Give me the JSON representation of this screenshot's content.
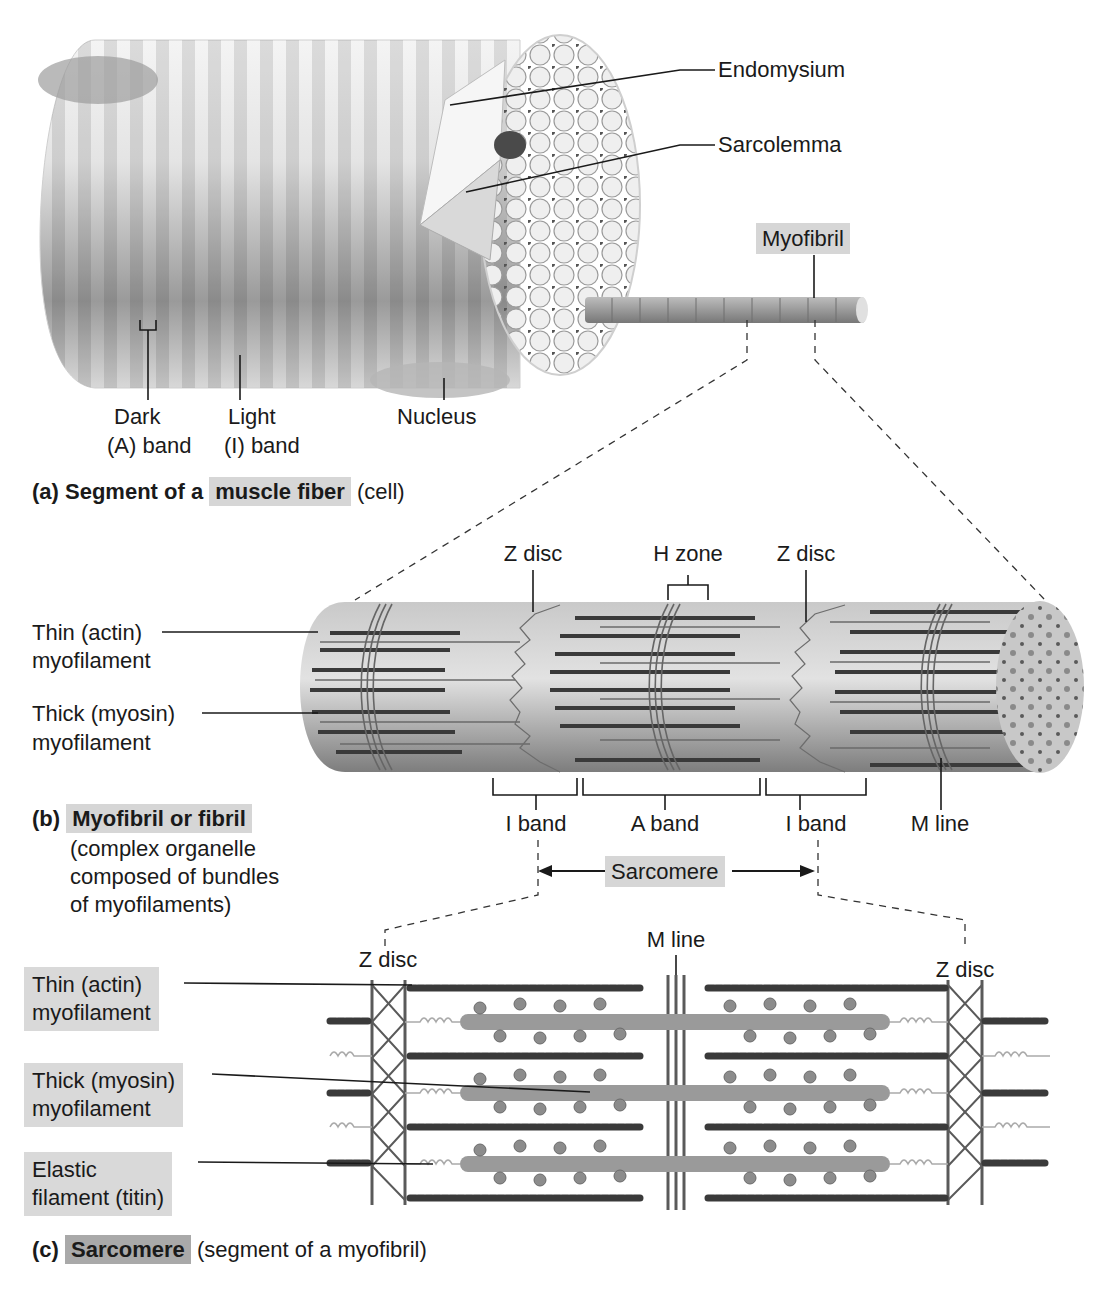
{
  "figure": {
    "colors": {
      "label_highlight": "#d6d6d6",
      "label_highlight_dark": "#a9a9a9",
      "line": "#1a1a1a",
      "fiber_light": "#e6e6e6",
      "fiber_dark": "#8a8a8a",
      "filament_thick": "#3a3a3a",
      "filament_thin": "#6a6a6a"
    }
  },
  "panel_a": {
    "labels": {
      "endomysium": "Endomysium",
      "sarcolemma": "Sarcolemma",
      "myofibril": "Myofibril",
      "dark_band_line1": "Dark",
      "dark_band_line2": "(A) band",
      "light_band_line1": "Light",
      "light_band_line2": "(I) band",
      "nucleus": "Nucleus"
    },
    "caption": {
      "letter": "(a)",
      "bold_prefix": "Segment of a",
      "bold_highlight": "muscle fiber",
      "suffix": "(cell)"
    }
  },
  "panel_b": {
    "labels": {
      "z_disc_left": "Z disc",
      "h_zone": "H zone",
      "z_disc_right": "Z disc",
      "thin_line1": "Thin (actin)",
      "thin_line2": "myofilament",
      "thick_line1": "Thick (myosin)",
      "thick_line2": "myofilament",
      "i_band_left": "I band",
      "a_band": "A band",
      "i_band_right": "I band",
      "m_line": "M line",
      "sarcomere": "Sarcomere"
    },
    "caption": {
      "letter": "(b)",
      "bold_highlight": "Myofibril or fibril",
      "desc_line1": "(complex organelle",
      "desc_line2": "composed of bundles",
      "desc_line3": "of myofilaments)"
    }
  },
  "panel_c": {
    "labels": {
      "z_disc_left": "Z disc",
      "m_line": "M line",
      "z_disc_right": "Z disc",
      "thin_line1": "Thin (actin)",
      "thin_line2": "myofilament",
      "thick_line1": "Thick (myosin)",
      "thick_line2": "myofilament",
      "elastic_line1": "Elastic",
      "elastic_line2": "filament (titin)"
    },
    "caption": {
      "letter": "(c)",
      "bold_highlight": "Sarcomere",
      "suffix": "(segment of a myofibril)"
    }
  }
}
